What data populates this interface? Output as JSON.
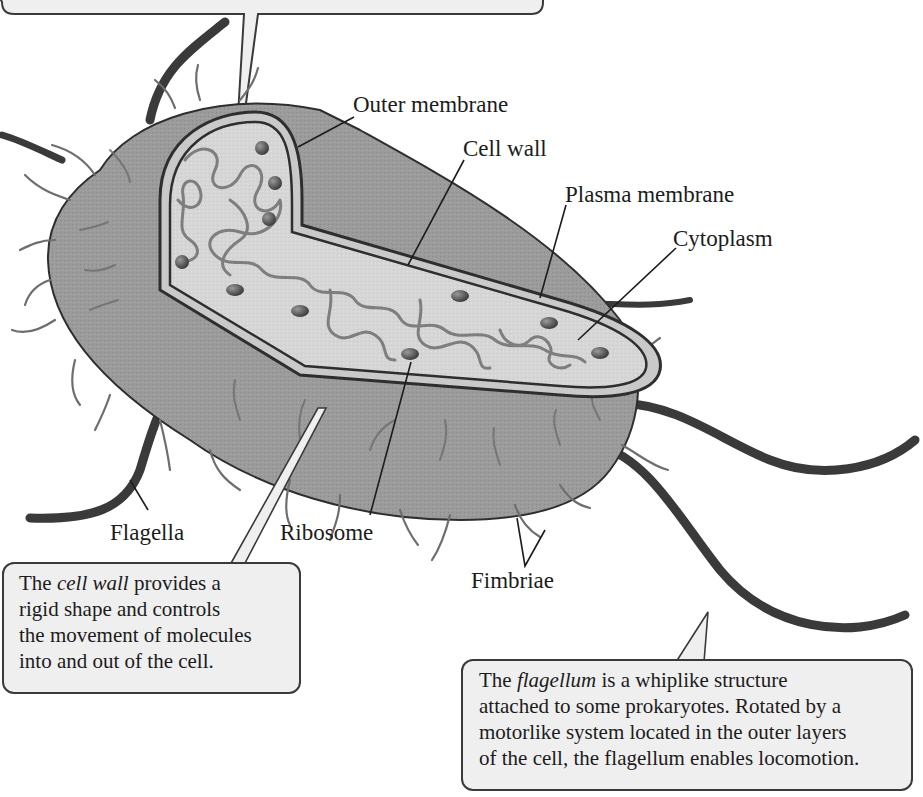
{
  "diagram": {
    "colors": {
      "cell_body": "#9a9a9a",
      "cell_interior": "#d4d4d4",
      "wall_band": "#c9c9c9",
      "outline": "#2e2e2e",
      "flagellum": "#3a3a3a",
      "fimbria": "#6e6e6e",
      "ribosome": "#5a5a5a",
      "dna": "#8c8c8c",
      "callout_bg": "#efefef"
    },
    "labels": {
      "outer_membrane": "Outer membrane",
      "cell_wall": "Cell wall",
      "plasma_membrane": "Plasma membrane",
      "cytoplasm": "Cytoplasm",
      "flagella": "Flagella",
      "ribosome": "Ribosome",
      "fimbriae": "Fimbriae"
    },
    "callouts": {
      "top_partial": {
        "note": "Callout box cut off at top edge; text not visible"
      },
      "cell_wall": {
        "lines": [
          {
            "pre": "The ",
            "em": "cell wall",
            "post": " provides a"
          },
          {
            "text": "rigid shape and controls"
          },
          {
            "text": "the movement of molecules"
          },
          {
            "text": "into and out of the cell."
          }
        ]
      },
      "flagellum": {
        "lines": [
          {
            "pre": "The ",
            "em": "flagellum",
            "post": " is a whiplike structure"
          },
          {
            "text": "attached to some prokaryotes. Rotated by a"
          },
          {
            "text": "motorlike system located in the outer layers"
          },
          {
            "text": "of the cell, the flagellum enables locomotion."
          }
        ]
      }
    }
  }
}
